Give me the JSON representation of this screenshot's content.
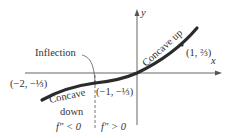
{
  "diagram": {
    "axes": {
      "x_label": "x",
      "y_label": "y"
    },
    "points": [
      {
        "label": "(−2, −⅓)"
      },
      {
        "label": "(−1, −⅓)"
      },
      {
        "label": "(1, ⅔)"
      }
    ],
    "annotations": {
      "inflection": "Inflection",
      "concave_down_1": "Concave",
      "concave_down_2": "down",
      "concave_up": "Concave up",
      "fpp_neg": "f″ < 0",
      "fpp_pos": "f″ > 0"
    },
    "colors": {
      "curve": "#2b2b2b",
      "axis": "#555555"
    }
  }
}
